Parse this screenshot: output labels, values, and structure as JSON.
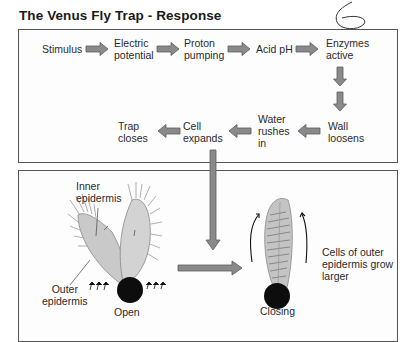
{
  "title": "The Venus Fly Trap - Response",
  "annotation": "6",
  "flow": {
    "row1": [
      {
        "id": "stimulus",
        "lines": [
          "Stimulus"
        ]
      },
      {
        "id": "electric-potential",
        "lines": [
          "Electric",
          "potential"
        ]
      },
      {
        "id": "proton-pumping",
        "lines": [
          "Proton",
          "pumping"
        ]
      },
      {
        "id": "acid-ph",
        "lines": [
          "Acid pH"
        ]
      },
      {
        "id": "enzymes-active",
        "lines": [
          "Enzymes",
          "active"
        ]
      }
    ],
    "row2": [
      {
        "id": "wall-loosens",
        "lines": [
          "Wall",
          "loosens"
        ]
      },
      {
        "id": "water-rushes-in",
        "lines": [
          "Water",
          "rushes",
          "in"
        ]
      },
      {
        "id": "cell-expands",
        "lines": [
          "Cell",
          "expands"
        ]
      },
      {
        "id": "trap-closes",
        "lines": [
          "Trap",
          "closes"
        ]
      }
    ]
  },
  "illustration": {
    "inner_epidermis": [
      "Inner",
      "epidermis"
    ],
    "outer_epidermis": [
      "Outer",
      "epidermis"
    ],
    "open_label": "Open",
    "closing_label": "Closing",
    "growth_note": [
      "Cells of outer",
      "epidermis grow",
      "larger"
    ]
  },
  "colors": {
    "arrow_fill": "#8a8a8a",
    "arrow_stroke": "#5a5a5a",
    "box_border": "#555555",
    "leaf_fill": "#c9c9c9",
    "base": "#0d0d0d"
  }
}
